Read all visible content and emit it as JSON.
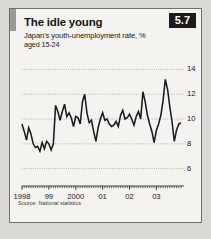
{
  "figure": {
    "badge": "5.7",
    "title": "The idle young",
    "subtitle": "Japan's youth-unemployment rate, %",
    "subtitle2": "aged 15-24",
    "source": "Source: National statistics"
  },
  "colors": {
    "panel_background": "#f4f3ef",
    "page_background": "#d9d9d6",
    "line": "#1b1b1b",
    "gridline": "#8e8e8c",
    "badge_background": "#1b1b1b",
    "badge_text": "#ffffff",
    "accent_bar": "#9a9a98",
    "border": "#6f6f6f"
  },
  "chart_data": {
    "type": "line",
    "title": "The idle young",
    "subtitle": "Japan's youth-unemployment rate, %  aged 15-24",
    "xlabel": "",
    "ylabel": "%",
    "ylim": [
      5,
      14.6
    ],
    "yticks": [
      6,
      8,
      10,
      12,
      14
    ],
    "ytick_labels": [
      "6",
      "8",
      "10",
      "12",
      "14"
    ],
    "grid": true,
    "legend": false,
    "xlim": [
      "1998-01",
      "2003-12"
    ],
    "xtick_labels": [
      "1998",
      "99",
      "2000",
      "01",
      "02",
      "03"
    ],
    "xtick_positions": [
      0,
      12,
      24,
      36,
      48,
      60
    ],
    "x_minor_ticks": "monthly",
    "series": [
      {
        "name": "Japan youth unemployment rate",
        "values": [
          9.6,
          9.0,
          8.3,
          9.3,
          8.8,
          8.0,
          7.7,
          7.8,
          7.4,
          8.1,
          7.6,
          8.2,
          8.0,
          7.5,
          8.0,
          11.1,
          10.6,
          9.9,
          10.6,
          11.2,
          10.2,
          10.5,
          10.1,
          9.4,
          10.2,
          10.1,
          9.6,
          11.4,
          12.0,
          10.5,
          9.7,
          9.9,
          9.0,
          8.2,
          9.3,
          10.0,
          10.5,
          9.9,
          10.0,
          9.6,
          9.4,
          9.5,
          9.8,
          9.4,
          10.3,
          10.7,
          10.0,
          10.1,
          10.4,
          10.0,
          9.5,
          10.2,
          10.6,
          10.0,
          12.2,
          11.4,
          10.3,
          9.6,
          9.0,
          8.1,
          9.1,
          9.6,
          10.3,
          11.5,
          13.2,
          12.4,
          11.0,
          9.8,
          8.2,
          9.1,
          9.6,
          9.7
        ]
      }
    ]
  }
}
